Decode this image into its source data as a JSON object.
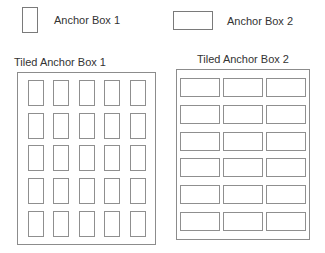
{
  "figure": {
    "background_color": "#ffffff",
    "stroke_color": "#8c8c8c",
    "text_color": "#333333"
  },
  "legend": {
    "items": [
      {
        "label": "Anchor Box 1",
        "swatch_shape": "tall-rectangle",
        "swatch_width_px": 16,
        "swatch_height_px": 26
      },
      {
        "label": "Anchor Box 2",
        "swatch_shape": "wide-rectangle",
        "swatch_width_px": 40,
        "swatch_height_px": 19
      }
    ]
  },
  "panels": [
    {
      "title": "Tiled Anchor Box 1",
      "columns": 5,
      "rows": 5,
      "tile_count": 25,
      "tile_shape": "tall-rectangle",
      "tile_width_px": 16,
      "tile_height_px": 26
    },
    {
      "title": "Tiled Anchor Box 2",
      "columns": 3,
      "rows": 6,
      "tile_count": 18,
      "tile_shape": "wide-rectangle",
      "tile_width_px": 40,
      "tile_height_px": 19
    }
  ]
}
